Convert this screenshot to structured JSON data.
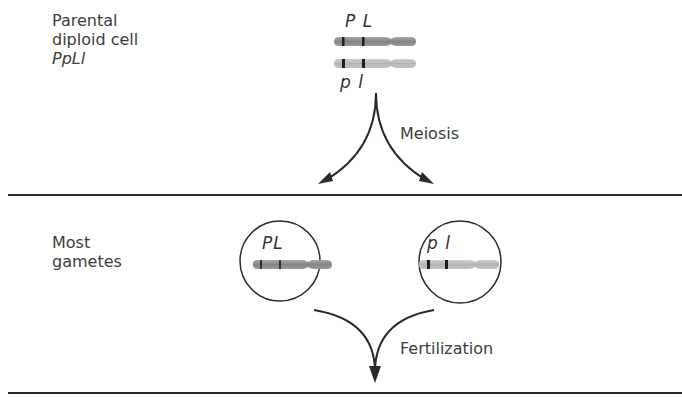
{
  "parental": {
    "label_line1": "Parental",
    "label_line2": "diploid cell",
    "genotype": "PpLl",
    "chromosome_top_alleles": "P L",
    "chromosome_bottom_alleles": "p l"
  },
  "meiosis": {
    "label": "Meiosis"
  },
  "gametes": {
    "label_line1": "Most",
    "label_line2": "gametes",
    "left_alleles": "PL",
    "right_alleles": "p l"
  },
  "fertilization": {
    "label": "Fertilization"
  },
  "colors": {
    "chromosome_dark": "#8a8a8a",
    "chromosome_light": "#b8b8b8",
    "band": "#1e1e1e",
    "line": "#2a2a2a"
  }
}
